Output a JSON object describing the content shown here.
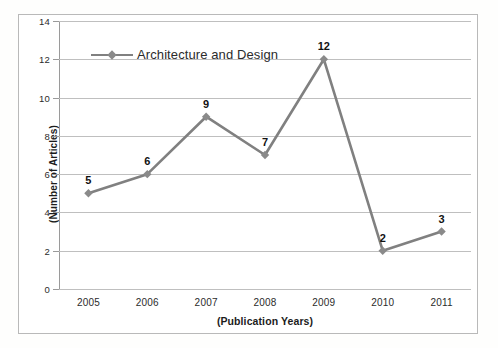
{
  "chart_data": {
    "type": "line",
    "title": "",
    "subtitle": "",
    "xlabel": "(Publication Years)",
    "ylabel": "(Number of Articles)",
    "categories": [
      "2005",
      "2006",
      "2007",
      "2008",
      "2009",
      "2010",
      "2011"
    ],
    "series": [
      {
        "name": "Architecture and Design",
        "values": [
          5,
          6,
          9,
          7,
          12,
          2,
          3
        ],
        "color": "#808080",
        "marker": "diamond"
      }
    ],
    "ylim": [
      0,
      14
    ],
    "ytick_step": 2,
    "yticks": [
      "14",
      "12",
      "10",
      "8",
      "6",
      "4",
      "2",
      "0"
    ],
    "grid": true,
    "grid_axis": "y",
    "legend": true,
    "legend_position": "top-left-inside",
    "data_labels": [
      "5",
      "6",
      "9",
      "7",
      "12",
      "2",
      "3"
    ],
    "colors": {
      "series": "#808080",
      "gridline": "#bfbfbf",
      "axis": "#9a9a9a",
      "frame": "#b9b9b9",
      "text": "#2b2b2b",
      "label_text": "#111111",
      "background": "#ffffff"
    }
  },
  "legend": {
    "entries": [
      {
        "label": "Architecture and Design",
        "color": "#808080"
      }
    ]
  }
}
